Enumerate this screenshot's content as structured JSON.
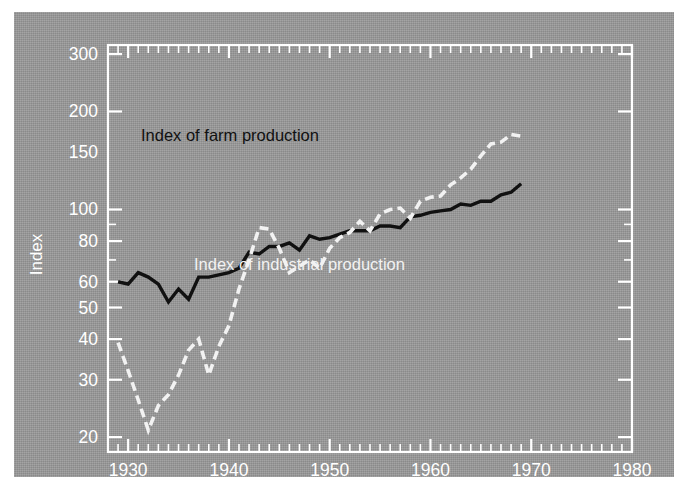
{
  "figure": {
    "background_color": "#9a9a9a",
    "frame_color": "#ffffff",
    "page_background": "#ffffff"
  },
  "axes": {
    "y_title": "Index",
    "y_ticks": [
      20,
      30,
      40,
      50,
      60,
      80,
      100,
      150,
      200,
      300
    ],
    "y_tick_labels": [
      "20",
      "30",
      "40",
      "50",
      "60",
      "80",
      "100",
      "150",
      "200",
      "300"
    ],
    "x_ticks": [
      1930,
      1940,
      1950,
      1960,
      1970,
      1980
    ],
    "x_tick_labels": [
      "1930",
      "1940",
      "1950",
      "1960",
      "1970",
      "1980"
    ]
  },
  "annotations": {
    "farm_label": "Index of farm production",
    "industrial_label": "Index of industrial production"
  },
  "chart_data": {
    "type": "line",
    "title": "",
    "xlabel": "",
    "ylabel": "Index",
    "yscale": "log",
    "xlim": [
      1928,
      1980
    ],
    "ylim": [
      18,
      320
    ],
    "grid": false,
    "legend_position": "inline-annotation",
    "y_tick_values": [
      20,
      30,
      40,
      50,
      60,
      80,
      100,
      150,
      200,
      300
    ],
    "x_tick_values": [
      1930,
      1940,
      1950,
      1960,
      1970,
      1980
    ],
    "series": [
      {
        "name": "Index of farm production",
        "style": "solid",
        "color": "#111111",
        "x": [
          1929,
          1930,
          1931,
          1932,
          1933,
          1934,
          1935,
          1936,
          1937,
          1938,
          1939,
          1940,
          1941,
          1942,
          1943,
          1944,
          1945,
          1946,
          1947,
          1948,
          1949,
          1950,
          1951,
          1952,
          1953,
          1954,
          1955,
          1956,
          1957,
          1958,
          1959,
          1960,
          1961,
          1962,
          1963,
          1964,
          1965,
          1966,
          1967,
          1968,
          1969
        ],
        "y": [
          60,
          59,
          64,
          62,
          59,
          52,
          57,
          53,
          62,
          62,
          63,
          64,
          66,
          74,
          73,
          77,
          77,
          79,
          75,
          83,
          81,
          82,
          84,
          86,
          86,
          86,
          89,
          89,
          88,
          95,
          96,
          98,
          99,
          100,
          104,
          103,
          106,
          106,
          111,
          113,
          120
        ],
        "start_value": 60,
        "end_value": 120,
        "min_value": 52,
        "min_year": 1934,
        "max_value": 120,
        "max_year": 1969
      },
      {
        "name": "Index of industrial production",
        "style": "dashed",
        "color": "#f2f2f2",
        "x": [
          1929,
          1930,
          1931,
          1932,
          1933,
          1934,
          1935,
          1936,
          1937,
          1938,
          1939,
          1940,
          1941,
          1942,
          1943,
          1944,
          1945,
          1946,
          1947,
          1948,
          1949,
          1950,
          1951,
          1952,
          1953,
          1954,
          1955,
          1956,
          1957,
          1958,
          1959,
          1960,
          1961,
          1962,
          1963,
          1964,
          1965,
          1966,
          1967,
          1968,
          1969
        ],
        "y": [
          39,
          32,
          26,
          21,
          25,
          27,
          31,
          37,
          40,
          31,
          38,
          44,
          57,
          70,
          88,
          87,
          76,
          64,
          67,
          70,
          66,
          76,
          82,
          85,
          92,
          86,
          97,
          100,
          101,
          94,
          106,
          109,
          110,
          119,
          125,
          133,
          146,
          159,
          161,
          170,
          168
        ],
        "start_value": 39,
        "end_value": 168,
        "min_value": 21,
        "min_year": 1932,
        "max_value": 170,
        "max_year": 1968
      }
    ]
  }
}
